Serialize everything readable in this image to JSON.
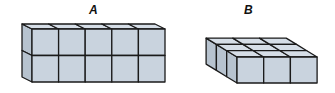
{
  "figures": [
    {
      "label": "A",
      "description": "Rectangular prism of cubes, 5 long × 1 deep × 2 high",
      "columns": 5,
      "depth": 1,
      "layers": 2,
      "cube_count": 10
    },
    {
      "label": "B",
      "description": "Rectangular prism of cubes, 3 long × 3 deep × 1 high",
      "columns": 3,
      "depth": 3,
      "layers": 1,
      "cube_count": 9
    }
  ],
  "colors": {
    "cube_front": "#c9d3de",
    "cube_top": "#d6dee7",
    "cube_side": "#b7c3cf",
    "edge": "#1a1a1a"
  }
}
